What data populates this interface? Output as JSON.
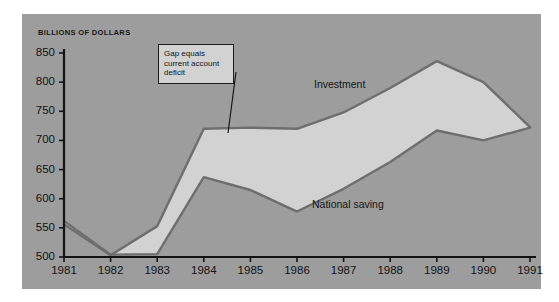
{
  "figure": {
    "background_color": "#ffffff",
    "panel_color": "#9d9d9d",
    "axis_color": "#111315"
  },
  "annotation": {
    "name": "gap-callout",
    "lines": [
      "Gap equals",
      "current account",
      "deficit"
    ],
    "box_fill": "#d2d2d2",
    "box_border": "#1c1e20",
    "leader_from": [
      236,
      72
    ],
    "leader_to": [
      228,
      133
    ]
  },
  "chart_data": {
    "type": "area",
    "title": "",
    "subtitle": "",
    "xlabel": "",
    "ylabel": "BILLIONS OF DOLLARS",
    "categories": [
      1981,
      1982,
      1983,
      1984,
      1985,
      1986,
      1987,
      1988,
      1989,
      1990,
      1991
    ],
    "x": [
      "1981",
      "1982",
      "1983",
      "1984",
      "1985",
      "1986",
      "1987",
      "1988",
      "1989",
      "1990",
      "1991"
    ],
    "xlim": [
      1981,
      1991
    ],
    "ylim": [
      500,
      850
    ],
    "yticks": [
      500,
      550,
      600,
      650,
      700,
      750,
      800,
      850
    ],
    "ytick_labels": [
      "500",
      "550",
      "600",
      "650",
      "700",
      "750",
      "800",
      "850"
    ],
    "xticks": [
      1981,
      1982,
      1983,
      1984,
      1985,
      1986,
      1987,
      1988,
      1989,
      1990,
      1991
    ],
    "xtick_labels": [
      "1981",
      "1982",
      "1983",
      "1984",
      "1985",
      "1986",
      "1987",
      "1988",
      "1989",
      "1990",
      "1991"
    ],
    "grid": false,
    "legend_position": "inline-annotations",
    "fill_between_color": "#d2d2d2",
    "series": [
      {
        "name": "Investment",
        "label": "Investment",
        "color": "#6e6e6e",
        "label_position": [
          314,
          78
        ],
        "values": [
          556,
          503,
          553,
          720,
          722,
          720,
          748,
          790,
          836,
          800,
          723
        ]
      },
      {
        "name": "National saving",
        "label": "National saving",
        "color": "#6e6e6e",
        "label_position": [
          312,
          198
        ],
        "values": [
          562,
          504,
          505,
          637,
          615,
          578,
          617,
          663,
          717,
          700,
          722
        ]
      }
    ],
    "annotations": [
      {
        "text": "Gap equals current account deficit",
        "target_year": 1985,
        "note": "Shaded band between Investment and National saving equals the current account deficit"
      }
    ]
  }
}
